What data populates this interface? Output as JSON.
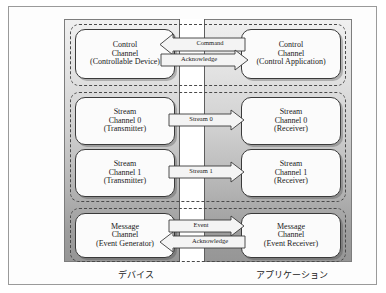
{
  "figure": {
    "regions": {
      "device_label": "デバイス",
      "application_label": "アプリケーション"
    },
    "colors": {
      "frame_border": "#9a9a9a",
      "stage_border": "#7d7d7d",
      "node_border": "#3a3a3a",
      "node_fill": "#fbfbfb",
      "group_dash": "#4a4a4a",
      "corridor_fill": "#ffffff",
      "gradient_top": "#f0f0f0",
      "gradient_bottom": "#969696",
      "text": "#1a1a1a"
    }
  },
  "groups": [
    {
      "id": "control",
      "name": "control-channel-group"
    },
    {
      "id": "stream",
      "name": "stream-channel-group"
    },
    {
      "id": "message",
      "name": "message-channel-group"
    }
  ],
  "nodes": {
    "control_device": {
      "line1": "Control",
      "line2": "Channel",
      "line3": "(Controllable Device)"
    },
    "control_application": {
      "line1": "Control",
      "line2": "Channel",
      "line3": "(Control Application)"
    },
    "stream0_transmitter": {
      "line1": "Stream",
      "line2": "Channel 0",
      "line3": "(Transmitter)"
    },
    "stream0_receiver": {
      "line1": "Stream",
      "line2": "Channel 0",
      "line3": "(Receiver)"
    },
    "stream1_transmitter": {
      "line1": "Stream",
      "line2": "Channel 1",
      "line3": "(Transmitter)"
    },
    "stream1_receiver": {
      "line1": "Stream",
      "line2": "Channel 1",
      "line3": "(Receiver)"
    },
    "message_generator": {
      "line1": "Message",
      "line2": "Channel",
      "line3": "(Event Generator)"
    },
    "message_receiver": {
      "line1": "Message",
      "line2": "Channel",
      "line3": "(Event Receiver)"
    }
  },
  "arrows": [
    {
      "id": "command",
      "label": "Command",
      "direction": "left",
      "from": "control_application",
      "to": "control_device"
    },
    {
      "id": "ack_control",
      "label": "Acknowledge",
      "direction": "right",
      "from": "control_device",
      "to": "control_application"
    },
    {
      "id": "stream0",
      "label": "Stream 0",
      "direction": "right",
      "from": "stream0_transmitter",
      "to": "stream0_receiver"
    },
    {
      "id": "stream1",
      "label": "Stream 1",
      "direction": "right",
      "from": "stream1_transmitter",
      "to": "stream1_receiver"
    },
    {
      "id": "event",
      "label": "Event",
      "direction": "right",
      "from": "message_generator",
      "to": "message_receiver"
    },
    {
      "id": "ack_message",
      "label": "Acknowledge",
      "direction": "left",
      "from": "message_receiver",
      "to": "message_generator"
    }
  ]
}
